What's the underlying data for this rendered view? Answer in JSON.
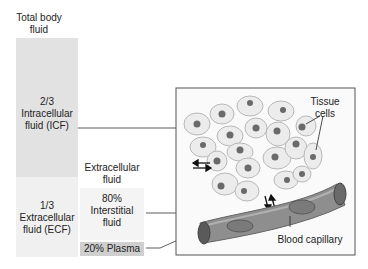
{
  "title": "Total body fluid",
  "compartments": {
    "icf": {
      "fraction": "2/3",
      "name": "Intracellular fluid (ICF)",
      "line1": "2/3",
      "line2": "Intracellular",
      "line3": "fluid (ICF)"
    },
    "ecf": {
      "fraction": "1/3",
      "name": "Extracellular fluid (ECF)",
      "line1": "1/3",
      "line2": "Extracellular",
      "line3": "fluid (ECF)"
    }
  },
  "extracellular_header": {
    "line1": "Extracellular",
    "line2": "fluid"
  },
  "ecf_subdivisions": {
    "interstitial": {
      "line1": "80%",
      "line2": "Interstitial",
      "line3": "fluid"
    },
    "plasma": {
      "label": "20% Plasma"
    }
  },
  "illustration": {
    "tissue_cells_label": {
      "line1": "Tissue",
      "line2": "cells"
    },
    "blood_capillary_label": "Blood capillary"
  },
  "colors": {
    "icf_block": "#e2e2e2",
    "ecf_block": "#f0f0f0",
    "plasma_block": "#cfcfcf",
    "capillary": "#8e8e8e",
    "cell_fill": "#ececec",
    "nucleus": "#6a6a6a"
  }
}
